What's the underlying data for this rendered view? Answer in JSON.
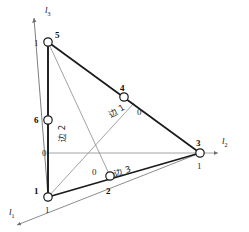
{
  "figure": {
    "type": "geometry-diagram",
    "background": "#ffffff",
    "stroke_dark": "#1a1a1a",
    "stroke_light": "#8a8a8a",
    "node_fill": "#ffffff"
  },
  "axes": [
    {
      "name": "l1",
      "label": "l",
      "subscript": "1",
      "label_x": 9,
      "label_y": 212,
      "direction": "down-left"
    },
    {
      "name": "l2",
      "label": "l",
      "subscript": "2",
      "label_x": 222,
      "label_y": 140,
      "direction": "right"
    },
    {
      "name": "l3",
      "label": "l",
      "subscript": "3",
      "label_x": 45,
      "label_y": 8,
      "direction": "up-left"
    }
  ],
  "nodes": [
    {
      "id": "1",
      "x": 48,
      "y": 197,
      "id_x": 34,
      "id_y": 187,
      "value": "1",
      "val_x": 45,
      "val_y": 206
    },
    {
      "id": "2",
      "x": 110,
      "y": 176,
      "id_x": 106,
      "id_y": 187,
      "value": "",
      "val_x": 0,
      "val_y": 0
    },
    {
      "id": "3",
      "x": 200,
      "y": 153,
      "id_x": 196,
      "id_y": 139,
      "value": "1",
      "val_x": 197,
      "val_y": 162
    },
    {
      "id": "4",
      "x": 124,
      "y": 97,
      "id_x": 120,
      "id_y": 84,
      "value": "",
      "val_x": 0,
      "val_y": 0
    },
    {
      "id": "5",
      "x": 48,
      "y": 42,
      "id_x": 55,
      "id_y": 31,
      "value": "1",
      "val_x": 34,
      "val_y": 39
    },
    {
      "id": "6",
      "x": 48,
      "y": 120,
      "id_x": 34,
      "id_y": 116,
      "value": "",
      "val_x": 0,
      "val_y": 0
    }
  ],
  "edge_labels": [
    {
      "name": "edge-1",
      "text": "边 1",
      "x": 107,
      "y": 104
    },
    {
      "name": "edge-2",
      "text": "边 2",
      "x": 58,
      "y": 133
    },
    {
      "name": "edge-3",
      "text": "边 3",
      "x": 113,
      "y": 170
    }
  ],
  "value_labels": [
    {
      "name": "zero-left-axis",
      "text": "0",
      "x": 42,
      "y": 149
    },
    {
      "name": "zero-median-4",
      "text": "0",
      "x": 137,
      "y": 108
    },
    {
      "name": "zero-median-2",
      "text": "0",
      "x": 92,
      "y": 168
    }
  ]
}
